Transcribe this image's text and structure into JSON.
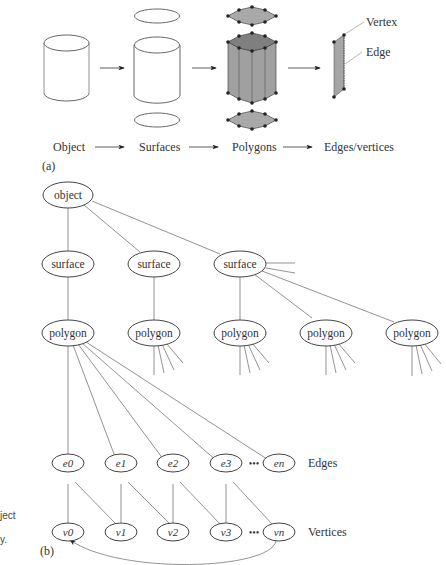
{
  "part_a": {
    "label": "(a)",
    "stages": [
      "Object",
      "Surfaces",
      "Polygons",
      "Edges/vertices"
    ],
    "callouts": {
      "vertex": "Vertex",
      "edge": "Edge"
    }
  },
  "part_b": {
    "label": "(b)",
    "root": "object",
    "surfaces": [
      "surface",
      "surface",
      "surface"
    ],
    "polygons": [
      "polygon",
      "polygon",
      "polygon",
      "polygon",
      "polygon"
    ],
    "edges": [
      "e0",
      "e1",
      "e2",
      "e3",
      "en"
    ],
    "vertices": [
      "v0",
      "v1",
      "v2",
      "v3",
      "vn"
    ],
    "row_labels": {
      "edges": "Edges",
      "vertices": "Vertices"
    },
    "ellipsis": "•••"
  },
  "side_fragments": [
    "ject",
    "y."
  ],
  "colors": {
    "polygon_fill": "#9a9a9a",
    "polygon_top": "#7d7d7d",
    "line": "#777777",
    "node_stroke": "#444444"
  }
}
